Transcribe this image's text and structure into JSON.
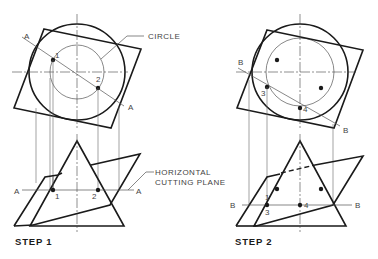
{
  "diagram": {
    "step1": {
      "caption": "STEP 1",
      "labels": {
        "circle": "CIRCLE",
        "cutting_plane_line1": "HORIZONTAL",
        "cutting_plane_line2": "CUTTING PLANE",
        "plane_letter": "A",
        "point1": "1",
        "point2": "2"
      }
    },
    "step2": {
      "caption": "STEP 2",
      "labels": {
        "plane_letter": "B",
        "point1": "1",
        "point3": "3",
        "point4": "4"
      }
    },
    "colors": {
      "object_line": "#1a1a1a",
      "construction_line": "#555555",
      "background": "#ffffff"
    }
  }
}
